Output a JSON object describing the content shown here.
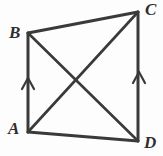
{
  "figure": {
    "kind": "geometry-diagram",
    "shape": "quadrilateral-with-diagonals",
    "background_color": "#fdfdfd",
    "stroke_color": "#3a3a3a",
    "label_color": "#2e2e2e",
    "stroke_width": 3,
    "diagonal_stroke_width": 2.6,
    "tick_stroke_width": 2.2,
    "vertices": [
      {
        "name": "A",
        "label": "A",
        "x": 28,
        "y": 132,
        "label_x": 8,
        "label_y": 120
      },
      {
        "name": "B",
        "label": "B",
        "x": 28,
        "y": 33,
        "label_x": 9,
        "label_y": 24
      },
      {
        "name": "C",
        "label": "C",
        "x": 138,
        "y": 12,
        "label_x": 145,
        "label_y": 1
      },
      {
        "name": "D",
        "label": "D",
        "x": 138,
        "y": 141,
        "label_x": 144,
        "label_y": 134
      }
    ],
    "sides": [
      {
        "name": "side-BC",
        "from": "B",
        "to": "C",
        "x1": 28,
        "y1": 33,
        "x2": 138,
        "y2": 12
      },
      {
        "name": "side-CD",
        "from": "C",
        "to": "D",
        "x1": 138,
        "y1": 12,
        "x2": 138,
        "y2": 141
      },
      {
        "name": "side-AD",
        "from": "A",
        "to": "D",
        "x1": 28,
        "y1": 132,
        "x2": 138,
        "y2": 141
      },
      {
        "name": "side-AB",
        "from": "A",
        "to": "B",
        "x1": 28,
        "y1": 132,
        "x2": 28,
        "y2": 33
      }
    ],
    "diagonals": [
      {
        "name": "diagonal-BD",
        "from": "B",
        "to": "D",
        "x1": 28,
        "y1": 33,
        "x2": 138,
        "y2": 141
      },
      {
        "name": "diagonal-AC",
        "from": "A",
        "to": "C",
        "x1": 28,
        "y1": 132,
        "x2": 138,
        "y2": 12
      }
    ],
    "intersection": {
      "name": "diagonal-intersection",
      "x": 76,
      "y": 80
    },
    "parallel_marks": [
      {
        "name": "parallel-tick-AB",
        "on_side": "side-AB",
        "direction": "up",
        "apex_x": 28,
        "apex_y": 78,
        "left_x": 22,
        "left_y": 89,
        "right_x": 34,
        "right_y": 89
      },
      {
        "name": "parallel-tick-DC",
        "on_side": "side-CD",
        "direction": "up",
        "apex_x": 139,
        "apex_y": 72,
        "left_x": 133,
        "left_y": 83,
        "right_x": 145,
        "right_y": 83
      }
    ]
  }
}
